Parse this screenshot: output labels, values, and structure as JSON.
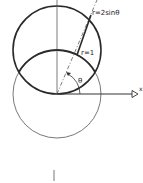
{
  "diagram": {
    "labels": {
      "upper_curve": "r=2sinθ",
      "unit_circle": "r=1",
      "angle": "θ",
      "x_axis": "x"
    },
    "colors": {
      "stroke": "#2a2a2a",
      "thin_stroke": "#555555",
      "background": "#ffffff"
    }
  }
}
